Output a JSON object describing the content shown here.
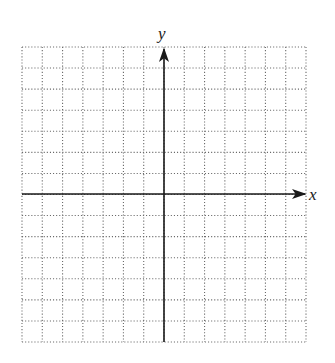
{
  "figure": {
    "type": "coordinate-grid",
    "axes": {
      "x_label": "x",
      "y_label": "y",
      "x_arrow": "positive-direction",
      "y_arrow": "positive-direction"
    },
    "grid": {
      "columns": 14,
      "rows": 14,
      "cells_left_of_y_axis": 7,
      "cells_right_of_y_axis": 7,
      "cells_above_x_axis": 7,
      "cells_below_x_axis": 7,
      "line_style": "dotted",
      "tick_labels": "none"
    },
    "colors": {
      "background": "#ffffff",
      "grid_dots": "#6a6a6a",
      "axes": "#1a1a1a"
    }
  }
}
